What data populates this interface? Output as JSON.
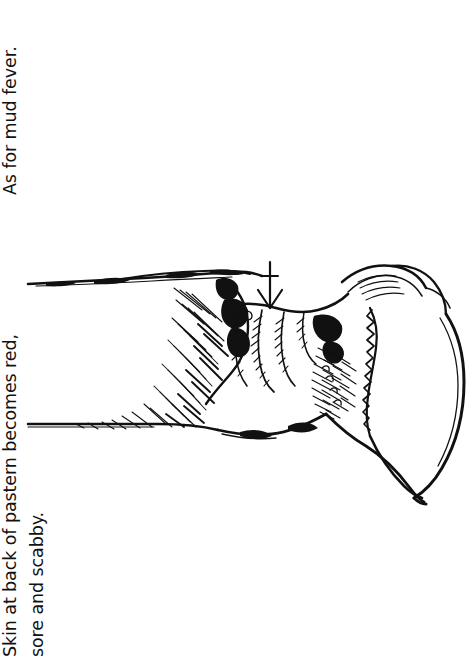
{
  "page": {
    "background_color": "#ffffff",
    "ink_color": "#121212",
    "orientation": "text rotated 90 degrees counter-clockwise (reads bottom to top)"
  },
  "caption": {
    "line_1": "Skin at back of pastern becomes red,",
    "line_2": "sore and scabby.",
    "line_3": "As for mud fever."
  },
  "illustration": {
    "title": "horse-lower-leg-pastern-hoof-line-drawing",
    "description": "Pen-and-ink line drawing of a horse's lower leg showing the fetlock, pastern and hoof, with hatched shading and wrinkled skin folds at the pastern.",
    "annotation": {
      "marker": "arrow",
      "points_to": "back of pastern",
      "direction": "down"
    },
    "stroke_color": "#111111",
    "fill_color": "#ffffff",
    "parts": [
      "cannon-bone-leg",
      "fetlock",
      "pastern-skin-folds",
      "coronet-band",
      "hoof-wall",
      "heel",
      "hatching-shading"
    ]
  }
}
